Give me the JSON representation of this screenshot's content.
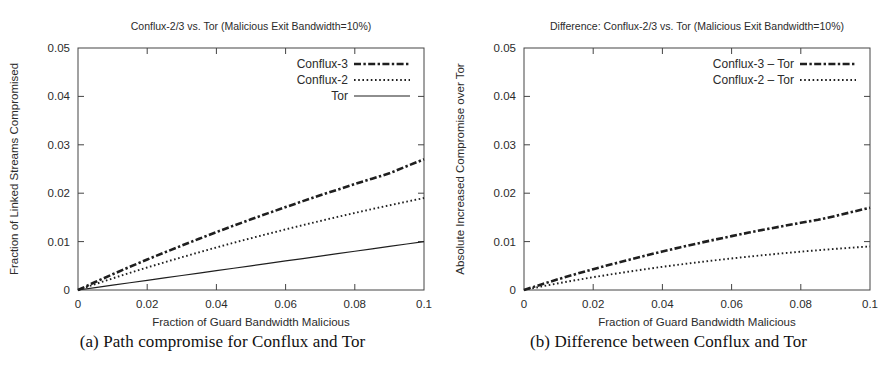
{
  "figure": {
    "panels": [
      {
        "id": "panel-a",
        "caption": "(a) Path compromise for Conflux and Tor",
        "chart_index": 0
      },
      {
        "id": "panel-b",
        "caption": "(b) Difference between Conflux and Tor",
        "chart_index": 1
      }
    ]
  },
  "chart_data": [
    {
      "type": "line",
      "title": "Conflux-2/3 vs. Tor (Malicious Exit Bandwidth=10%)",
      "xlabel": "Fraction of Guard Bandwidth Malicious",
      "ylabel": "Fraction of Linked Streams Compromised",
      "xlim": [
        0,
        0.1
      ],
      "ylim": [
        0,
        0.05
      ],
      "xticks": [
        0,
        0.02,
        0.04,
        0.06,
        0.08,
        0.1
      ],
      "xtick_labels": [
        "0",
        "0.02",
        "0.04",
        "0.06",
        "0.08",
        "0.1"
      ],
      "yticks": [
        0,
        0.01,
        0.02,
        0.03,
        0.04,
        0.05
      ],
      "ytick_labels": [
        "0",
        "0.01",
        "0.02",
        "0.03",
        "0.04",
        "0.05"
      ],
      "grid": false,
      "legend_position": "top-right",
      "x": [
        0,
        0.005,
        0.01,
        0.015,
        0.02,
        0.025,
        0.03,
        0.035,
        0.04,
        0.045,
        0.05,
        0.055,
        0.06,
        0.065,
        0.07,
        0.075,
        0.08,
        0.085,
        0.09,
        0.095,
        0.1
      ],
      "series": [
        {
          "name": "Conflux-3",
          "style": "dash-dot-thick",
          "color": "#1f1f1f",
          "values": [
            0,
            0.00165,
            0.00325,
            0.0048,
            0.0063,
            0.00775,
            0.00918,
            0.01058,
            0.01196,
            0.0133,
            0.0146,
            0.01588,
            0.01713,
            0.01836,
            0.01956,
            0.02073,
            0.02188,
            0.023,
            0.0241,
            0.02558,
            0.027
          ]
        },
        {
          "name": "Conflux-2",
          "style": "dotted",
          "color": "#1f1f1f",
          "values": [
            0,
            0.00122,
            0.0024,
            0.00354,
            0.00465,
            0.00572,
            0.00677,
            0.00779,
            0.00879,
            0.00976,
            0.0107,
            0.01162,
            0.01252,
            0.0134,
            0.01426,
            0.0151,
            0.01592,
            0.01672,
            0.0175,
            0.01826,
            0.019
          ]
        },
        {
          "name": "Tor",
          "style": "solid",
          "color": "#1f1f1f",
          "values": [
            0,
            0.0005,
            0.001,
            0.0015,
            0.002,
            0.0025,
            0.003,
            0.0035,
            0.004,
            0.0045,
            0.005,
            0.0055,
            0.006,
            0.0065,
            0.007,
            0.0075,
            0.008,
            0.0085,
            0.009,
            0.0095,
            0.01
          ]
        }
      ]
    },
    {
      "type": "line",
      "title": "Difference: Conflux-2/3 vs. Tor (Malicious Exit Bandwidth=10%)",
      "xlabel": "Fraction of Guard Bandwidth Malicious",
      "ylabel": "Absolute Increased Compromise over Tor",
      "xlim": [
        0,
        0.1
      ],
      "ylim": [
        0,
        0.05
      ],
      "xticks": [
        0,
        0.02,
        0.04,
        0.06,
        0.08,
        0.1
      ],
      "xtick_labels": [
        "0",
        "0.02",
        "0.04",
        "0.06",
        "0.08",
        "0.1"
      ],
      "yticks": [
        0,
        0.01,
        0.02,
        0.03,
        0.04,
        0.05
      ],
      "ytick_labels": [
        "0",
        "0.01",
        "0.02",
        "0.03",
        "0.04",
        "0.05"
      ],
      "grid": false,
      "legend_position": "top-right",
      "x": [
        0,
        0.005,
        0.01,
        0.015,
        0.02,
        0.025,
        0.03,
        0.035,
        0.04,
        0.045,
        0.05,
        0.055,
        0.06,
        0.065,
        0.07,
        0.075,
        0.08,
        0.085,
        0.09,
        0.095,
        0.1
      ],
      "series": [
        {
          "name": "Conflux-3 – Tor",
          "style": "dash-dot-thick",
          "color": "#1f1f1f",
          "values": [
            0,
            0.00115,
            0.00225,
            0.0033,
            0.0043,
            0.00525,
            0.00618,
            0.00708,
            0.00796,
            0.0088,
            0.0096,
            0.01038,
            0.01113,
            0.01186,
            0.01256,
            0.01323,
            0.01388,
            0.0145,
            0.0153,
            0.01615,
            0.017
          ]
        },
        {
          "name": "Conflux-2 – Tor",
          "style": "dotted",
          "color": "#1f1f1f",
          "values": [
            0,
            0.00072,
            0.0014,
            0.00204,
            0.00265,
            0.00322,
            0.00377,
            0.00429,
            0.00479,
            0.00526,
            0.0057,
            0.00612,
            0.00652,
            0.0069,
            0.00726,
            0.0076,
            0.00792,
            0.00822,
            0.0085,
            0.00876,
            0.009
          ]
        }
      ]
    }
  ]
}
